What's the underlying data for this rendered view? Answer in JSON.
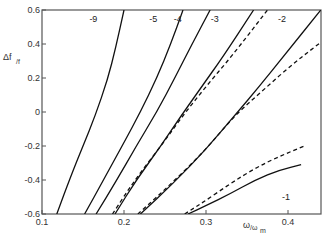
{
  "chart_data": {
    "type": "line",
    "title": "",
    "xlabel": "ω/ωm",
    "ylabel": "Δf/f",
    "xlim": [
      0.1,
      0.44
    ],
    "ylim": [
      -0.6,
      0.6
    ],
    "grid": false,
    "legend": "none (curves labeled inline)",
    "x_ticks": [
      0.1,
      0.2,
      0.3,
      0.4
    ],
    "x_tick_labels": [
      "0.1",
      "0.2",
      "0.3",
      "0.4"
    ],
    "y_ticks": [
      0.6,
      0.4,
      0.2,
      0,
      -0.2,
      -0.4,
      -0.6
    ],
    "y_tick_labels": [
      "0.6",
      "0.4",
      "0.2",
      "0",
      "-0.2",
      "-0.4",
      "-0.6"
    ],
    "series": [
      {
        "name": "-9",
        "style": "solid",
        "label": "-9",
        "label_pos": [
          0.17,
          0.55
        ],
        "x": [
          0.118,
          0.135,
          0.15,
          0.165,
          0.18,
          0.19,
          0.2
        ],
        "y": [
          -0.6,
          -0.38,
          -0.2,
          -0.02,
          0.19,
          0.38,
          0.6
        ]
      },
      {
        "name": "-5",
        "style": "solid",
        "label": "-5",
        "label_pos": [
          0.243,
          0.55
        ],
        "x": [
          0.152,
          0.175,
          0.2,
          0.22,
          0.24,
          0.257,
          0.272
        ],
        "y": [
          -0.6,
          -0.4,
          -0.18,
          0.0,
          0.2,
          0.4,
          0.6
        ]
      },
      {
        "name": "-4",
        "style": "solid",
        "label": "-4",
        "label_pos": [
          0.273,
          0.55
        ],
        "x": [
          0.166,
          0.19,
          0.215,
          0.24,
          0.262,
          0.283,
          0.305
        ],
        "y": [
          -0.6,
          -0.41,
          -0.2,
          0.0,
          0.2,
          0.4,
          0.6
        ]
      },
      {
        "name": "-3",
        "style": "solid",
        "label": "-3",
        "label_pos": [
          0.318,
          0.55
        ],
        "x": [
          0.189,
          0.215,
          0.245,
          0.27,
          0.295,
          0.32,
          0.358
        ],
        "y": [
          -0.6,
          -0.4,
          -0.2,
          -0.02,
          0.15,
          0.32,
          0.6
        ]
      },
      {
        "name": "-3 (dashed)",
        "style": "dashed",
        "x": [
          0.186,
          0.213,
          0.245,
          0.272,
          0.3,
          0.33,
          0.375
        ],
        "y": [
          -0.6,
          -0.4,
          -0.2,
          -0.02,
          0.15,
          0.32,
          0.6
        ]
      },
      {
        "name": "-2",
        "style": "solid",
        "label": "-2",
        "label_pos": [
          0.4,
          0.55
        ],
        "x": [
          0.22,
          0.26,
          0.3,
          0.335,
          0.365,
          0.395,
          0.44
        ],
        "y": [
          -0.6,
          -0.42,
          -0.22,
          -0.02,
          0.15,
          0.33,
          0.6
        ]
      },
      {
        "name": "-2 (dashed)",
        "style": "dashed",
        "x": [
          0.217,
          0.258,
          0.3,
          0.335,
          0.37,
          0.405,
          0.44
        ],
        "y": [
          -0.6,
          -0.42,
          -0.22,
          -0.02,
          0.13,
          0.28,
          0.41
        ]
      },
      {
        "name": "-1",
        "style": "solid",
        "label": "-1",
        "label_pos": [
          0.405,
          -0.5
        ],
        "x": [
          0.278,
          0.3,
          0.33,
          0.36,
          0.39,
          0.416
        ],
        "y": [
          -0.6,
          -0.55,
          -0.48,
          -0.4,
          -0.34,
          -0.31
        ]
      },
      {
        "name": "-1 (dashed)",
        "style": "dashed",
        "x": [
          0.274,
          0.3,
          0.33,
          0.36,
          0.39,
          0.42
        ],
        "y": [
          -0.6,
          -0.52,
          -0.42,
          -0.33,
          -0.26,
          -0.2
        ]
      }
    ]
  }
}
